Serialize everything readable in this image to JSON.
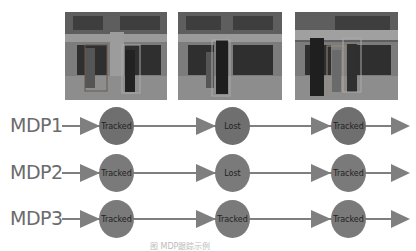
{
  "frames": [
    {
      "label": "frame-1"
    },
    {
      "label": "frame-2"
    },
    {
      "label": "frame-3"
    }
  ],
  "rows": [
    {
      "label": "MDP1",
      "node_color": "#6f6f6f",
      "states": [
        "Tracked",
        "Lost",
        "Tracked"
      ]
    },
    {
      "label": "MDP2",
      "node_color": "#7a7a7a",
      "states": [
        "Tracked",
        "Lost",
        "Tracked"
      ]
    },
    {
      "label": "MDP3",
      "node_color": "#7a7a7a",
      "states": [
        "Tracked",
        "Tracked",
        "Tracked"
      ]
    }
  ],
  "colors": {
    "arrow": "#7f7f7f",
    "label": "#6b6b6b"
  },
  "caption": "图  MDP跟踪示例"
}
